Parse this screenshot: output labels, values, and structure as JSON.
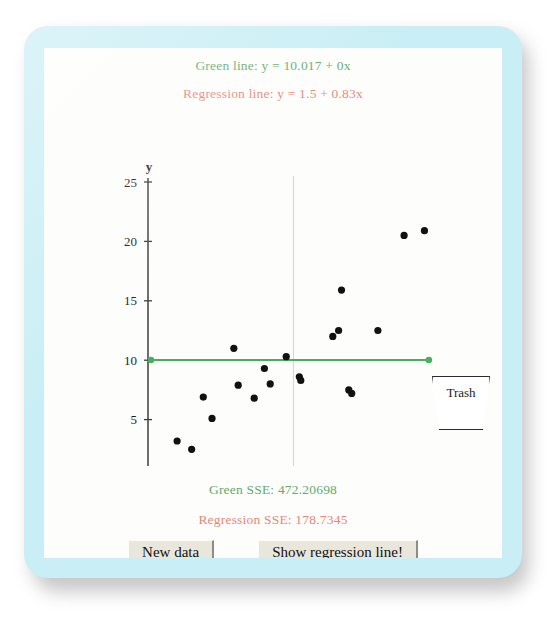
{
  "applet": {
    "frame_color": "#c9eef5",
    "canvas_color": "#fdfdfb"
  },
  "captions": {
    "green_line_equation": "Green line: y = 10.017 + 0x",
    "regression_line_equation": "Regression line: y = 1.5 + 0.83x",
    "green_sse": "Green SSE: 472.20698",
    "regression_sse": "Regression SSE: 178.7345"
  },
  "colors": {
    "green": "#63ab6f",
    "green_line": "#4aae60",
    "regression": "#e3897b",
    "axis": "#3c3c3c",
    "point": "#111111",
    "gridline": "#d9d9d9"
  },
  "trash": {
    "label": "Trash"
  },
  "buttons": {
    "new_data": "New data",
    "show_regression_line": "Show regression line!"
  },
  "chart_data": {
    "type": "scatter",
    "title": "",
    "xlabel": "x",
    "ylabel": "y",
    "xlim": [
      0,
      20
    ],
    "ylim": [
      0,
      25
    ],
    "xticks": [
      0,
      5,
      10,
      15,
      20
    ],
    "yticks": [
      0,
      5,
      10,
      15,
      20,
      25
    ],
    "grid": false,
    "vertical_reference_line_x": 10,
    "points": [
      {
        "x": 2.0,
        "y": 3.2
      },
      {
        "x": 3.0,
        "y": 2.5
      },
      {
        "x": 3.8,
        "y": 6.9
      },
      {
        "x": 4.4,
        "y": 5.1
      },
      {
        "x": 5.9,
        "y": 11.0
      },
      {
        "x": 6.2,
        "y": 7.9
      },
      {
        "x": 7.3,
        "y": 6.8
      },
      {
        "x": 8.0,
        "y": 9.3
      },
      {
        "x": 8.4,
        "y": 8.0
      },
      {
        "x": 9.5,
        "y": 10.3
      },
      {
        "x": 10.4,
        "y": 8.6
      },
      {
        "x": 10.5,
        "y": 8.3
      },
      {
        "x": 12.7,
        "y": 12.0
      },
      {
        "x": 13.1,
        "y": 12.5
      },
      {
        "x": 13.3,
        "y": 15.9
      },
      {
        "x": 13.8,
        "y": 7.5
      },
      {
        "x": 14.0,
        "y": 7.2
      },
      {
        "x": 15.8,
        "y": 12.5
      },
      {
        "x": 17.6,
        "y": 20.5
      },
      {
        "x": 19.0,
        "y": 20.9
      }
    ],
    "series": [
      {
        "name": "Green line",
        "type": "line",
        "color": "#4aae60",
        "intercept": 10.017,
        "slope": 0,
        "x_start": 0.2,
        "x_end": 19.3,
        "endpoint_markers": true,
        "sse": 472.20698
      },
      {
        "name": "Regression line",
        "type": "line",
        "color": "#e3897b",
        "intercept": 1.5,
        "slope": 0.83,
        "visible": false,
        "sse": 178.7345
      }
    ]
  }
}
